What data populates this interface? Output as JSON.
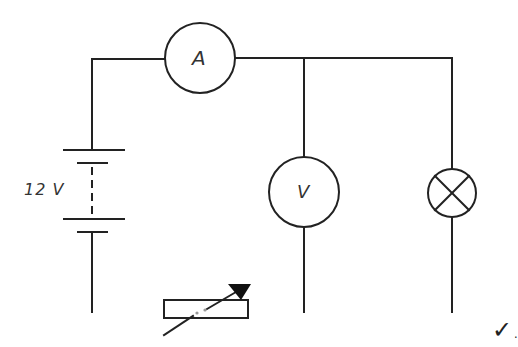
{
  "diagram": {
    "type": "circuit-schematic",
    "stroke_color": "#222222",
    "background": "#ffffff",
    "components": [
      {
        "id": "battery",
        "kind": "multi-cell-battery",
        "label": "12 V"
      },
      {
        "id": "ammeter",
        "kind": "ammeter",
        "label": "A"
      },
      {
        "id": "voltmeter",
        "kind": "voltmeter",
        "label": "V"
      },
      {
        "id": "lamp",
        "kind": "lamp",
        "label": ""
      },
      {
        "id": "rheostat",
        "kind": "variable-resistor",
        "label": ""
      }
    ],
    "annotation": {
      "checkmark": "✓."
    }
  },
  "labels": {
    "battery": "12 V",
    "ammeter": "A",
    "voltmeter": "V",
    "check": "✓."
  }
}
